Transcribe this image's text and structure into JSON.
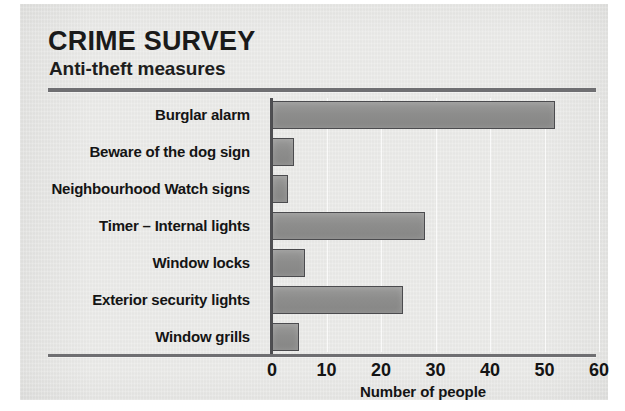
{
  "chart_data": {
    "type": "bar",
    "orientation": "horizontal",
    "title": "CRIME SURVEY",
    "subtitle": "Anti-theft measures",
    "xlabel": "Number of people",
    "ylabel": "",
    "xlim": [
      0,
      60
    ],
    "xticks": [
      0,
      10,
      20,
      30,
      40,
      50,
      60
    ],
    "grid": true,
    "legend": false,
    "categories": [
      "Burglar alarm",
      "Beware of the dog sign",
      "Neighbourhood Watch signs",
      "Timer – Internal lights",
      "Window locks",
      "Exterior security lights",
      "Window grills"
    ],
    "values": [
      52,
      4,
      3,
      28,
      6,
      24,
      5
    ],
    "bar_color": "#8f8f8e",
    "bar_border_color": "#4b4b4e"
  },
  "colors": {
    "paper": "#e9e9e7",
    "rule": "#6f6f72",
    "axis": "#4f4f52",
    "text": "#141414"
  }
}
